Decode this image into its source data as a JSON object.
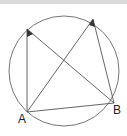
{
  "diagram": {
    "type": "circle-geometry",
    "circle": {
      "cx": 64,
      "cy": 71,
      "r": 55
    },
    "points": {
      "A": {
        "x": 27,
        "y": 112,
        "label": "A"
      },
      "B": {
        "x": 114,
        "y": 103,
        "label": "B"
      },
      "P": {
        "x": 27,
        "y": 29
      },
      "Q": {
        "x": 93,
        "y": 19
      }
    },
    "labels": {
      "A": "A",
      "B": "B"
    },
    "colors": {
      "stroke": "#555555",
      "marker": "#333333",
      "bar": "#d9d9d9"
    }
  }
}
